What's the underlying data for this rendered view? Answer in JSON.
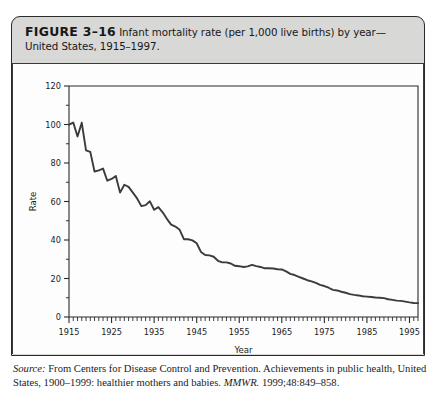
{
  "figure": {
    "number_label": "FIGURE 3–16",
    "caption_text": " Infant mortality rate (per 1,000 live births) by year—United States, 1915–1997."
  },
  "source": {
    "label": "Source:",
    "text": " From Centers for Disease Control and Prevention. Achievements in public health, United States, 1900–1999: healthier mothers and babies. ",
    "journal": "MMWR.",
    "citation": " 1999;48:849–858."
  },
  "chart_data": {
    "type": "line",
    "title": "Infant mortality rate (per 1,000 live births) by year—United States, 1915–1997",
    "xlabel": "Year",
    "ylabel": "Rate",
    "xlim": [
      1915,
      1997
    ],
    "ylim": [
      0,
      120
    ],
    "ytick_labels": [
      "0",
      "20",
      "40",
      "60",
      "80",
      "100",
      "120"
    ],
    "yticks": [
      0,
      20,
      40,
      60,
      80,
      100,
      120
    ],
    "yminor_step": 10,
    "xtick_labels": [
      "1915",
      "1925",
      "1935",
      "1945",
      "1955",
      "1965",
      "1975",
      "1985",
      "1995"
    ],
    "xticks": [
      1915,
      1925,
      1935,
      1945,
      1955,
      1965,
      1975,
      1985,
      1995
    ],
    "xminor_step": 1,
    "grid": false,
    "legend": false,
    "line_color": "#3b3b3b",
    "series": [
      {
        "name": "Infant mortality rate",
        "x": [
          1915,
          1916,
          1917,
          1918,
          1919,
          1920,
          1921,
          1922,
          1923,
          1924,
          1925,
          1926,
          1927,
          1928,
          1929,
          1930,
          1931,
          1932,
          1933,
          1934,
          1935,
          1936,
          1937,
          1938,
          1939,
          1940,
          1941,
          1942,
          1943,
          1944,
          1945,
          1946,
          1947,
          1948,
          1949,
          1950,
          1951,
          1952,
          1953,
          1954,
          1955,
          1956,
          1957,
          1958,
          1959,
          1960,
          1961,
          1962,
          1963,
          1964,
          1965,
          1966,
          1967,
          1968,
          1969,
          1970,
          1971,
          1972,
          1973,
          1974,
          1975,
          1976,
          1977,
          1978,
          1979,
          1980,
          1981,
          1982,
          1983,
          1984,
          1985,
          1986,
          1987,
          1988,
          1989,
          1990,
          1991,
          1992,
          1993,
          1994,
          1995,
          1996,
          1997
        ],
        "values": [
          99.9,
          101.0,
          93.8,
          100.9,
          86.6,
          85.8,
          75.6,
          76.2,
          77.1,
          70.8,
          71.7,
          73.3,
          64.6,
          68.7,
          67.6,
          64.6,
          61.6,
          57.6,
          58.1,
          60.1,
          55.7,
          57.1,
          54.4,
          51.0,
          48.0,
          47.0,
          45.3,
          40.4,
          40.4,
          39.8,
          38.3,
          33.8,
          32.2,
          32.0,
          31.3,
          29.2,
          28.4,
          28.4,
          27.8,
          26.6,
          26.4,
          26.0,
          26.3,
          27.1,
          26.4,
          26.0,
          25.3,
          25.3,
          25.2,
          24.8,
          24.7,
          23.7,
          22.4,
          21.8,
          20.9,
          20.0,
          19.1,
          18.5,
          17.7,
          16.7,
          16.1,
          15.2,
          14.1,
          13.8,
          13.1,
          12.6,
          11.9,
          11.5,
          11.2,
          10.8,
          10.6,
          10.4,
          10.1,
          10.0,
          9.8,
          9.2,
          8.9,
          8.5,
          8.4,
          8.0,
          7.6,
          7.3,
          7.2
        ]
      }
    ]
  }
}
